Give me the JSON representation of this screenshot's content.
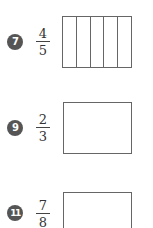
{
  "problems": [
    {
      "number": "7",
      "numerator": "4",
      "denominator": "5",
      "box_divisions": 5
    },
    {
      "number": "9",
      "numerator": "2",
      "denominator": "3",
      "box_divisions": 1
    },
    {
      "number": "11",
      "numerator": "7",
      "denominator": "8",
      "box_divisions": 1
    }
  ],
  "colors": {
    "badge": "#555555",
    "line": "#666666",
    "text": "#333333"
  }
}
